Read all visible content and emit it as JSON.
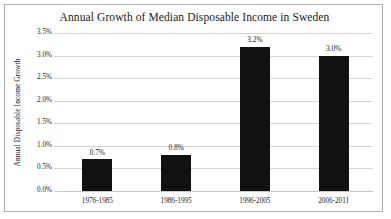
{
  "chart_data": {
    "type": "bar",
    "title": "Annual Growth of Median Disposable Income in Sweden",
    "xlabel": "",
    "ylabel": "Annual Disposable Income Growth",
    "categories": [
      "1976-1985",
      "1986-1995",
      "1996-2005",
      "2006-2011"
    ],
    "values": [
      0.7,
      0.8,
      3.2,
      3.0
    ],
    "data_labels": [
      "0.7%",
      "0.8%",
      "3.2%",
      "3.0%"
    ],
    "ylim": [
      0,
      3.5
    ],
    "ytick_values": [
      0.0,
      0.5,
      1.0,
      1.5,
      2.0,
      2.5,
      3.0,
      3.5
    ],
    "ytick_labels": [
      "0.0%",
      "0.5%",
      "1.0%",
      "1.5%",
      "2.0%",
      "2.5%",
      "3.0%",
      "3.5%"
    ],
    "grid": true,
    "legend": false,
    "bar_color": "#111111",
    "gridline_color": "#d4d4d4",
    "frame_color": "#b0b0b0",
    "background_color": "#ffffff"
  }
}
